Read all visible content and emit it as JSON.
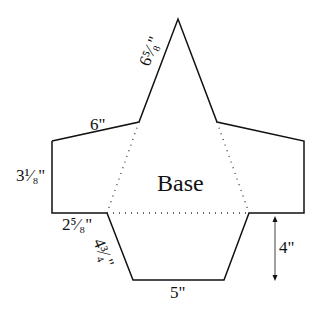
{
  "diagram": {
    "title": "Base",
    "labels": {
      "slant_top": "6⁵⁄₈\"",
      "top_edge": "6\"",
      "side_edge": "3¹⁄₈\"",
      "bottom_ledge": "2⁵⁄₈\"",
      "lower_slant": "4³⁄₄\"",
      "bottom_edge": "5\"",
      "height": "4\""
    }
  }
}
